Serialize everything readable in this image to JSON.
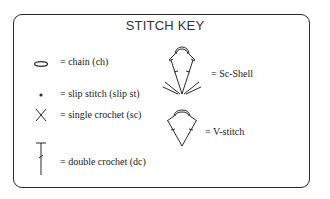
{
  "title": "STITCH KEY",
  "items": [
    {
      "symbol": "chain-oval",
      "label": "= chain (ch)"
    },
    {
      "symbol": "dot",
      "label": "= slip stitch (slip st)"
    },
    {
      "symbol": "x-cross",
      "label": "= single crochet (sc)"
    },
    {
      "symbol": "t-post",
      "label": "= double crochet (dc)"
    },
    {
      "symbol": "sc-shell",
      "label": "= Sc-Shell"
    },
    {
      "symbol": "v-stitch",
      "label": "= V-stitch"
    }
  ],
  "colors": {
    "stroke": "#2a2a2a",
    "background": "#ffffff"
  }
}
